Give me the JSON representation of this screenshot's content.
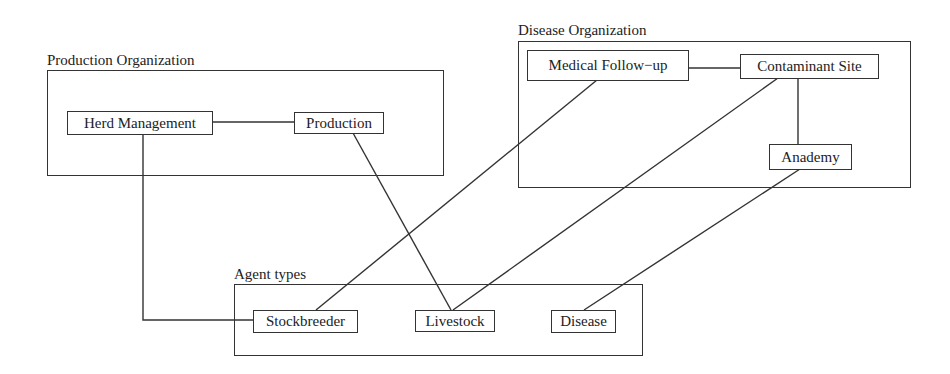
{
  "diagram": {
    "groups": {
      "production": {
        "label": "Production Organization"
      },
      "disease": {
        "label": "Disease Organization"
      },
      "agents": {
        "label": "Agent types"
      }
    },
    "nodes": {
      "herd_management": "Herd Management",
      "production": "Production",
      "medical_follow_up": "Medical Follow−up",
      "contaminant_site": "Contaminant Site",
      "anademy": "Anademy",
      "stockbreeder": "Stockbreeder",
      "livestock": "Livestock",
      "disease": "Disease"
    },
    "edges": [
      [
        "Herd Management",
        "Production"
      ],
      [
        "Medical Follow−up",
        "Contaminant Site"
      ],
      [
        "Contaminant Site",
        "Anademy"
      ],
      [
        "Herd Management",
        "Stockbreeder"
      ],
      [
        "Production",
        "Livestock"
      ],
      [
        "Medical Follow−up",
        "Stockbreeder"
      ],
      [
        "Contaminant Site",
        "Livestock"
      ],
      [
        "Anademy",
        "Disease"
      ]
    ],
    "colors": {
      "stroke": "#333333",
      "background": "#ffffff"
    }
  }
}
